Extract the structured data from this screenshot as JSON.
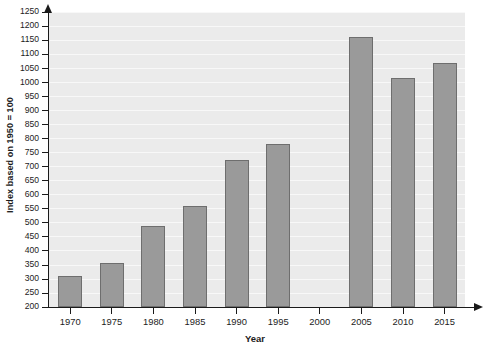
{
  "chart_data": {
    "type": "bar",
    "title": "",
    "xlabel": "Year",
    "ylabel": "Index based on 1950 = 100",
    "categories": [
      "1970",
      "1975",
      "1980",
      "1985",
      "1990",
      "1995",
      "2000",
      "2005",
      "2010",
      "2015"
    ],
    "values": [
      310,
      355,
      487,
      557,
      722,
      778,
      null,
      1160,
      1015,
      1070
    ],
    "ylim": [
      200,
      1250
    ],
    "ytick_labels": [
      "200",
      "250",
      "300",
      "350",
      "400",
      "450",
      "500",
      "550",
      "600",
      "650",
      "700",
      "750",
      "800",
      "850",
      "900",
      "950",
      "1000",
      "1050",
      "1100",
      "1150",
      "1200",
      "1250"
    ],
    "ytick_values": [
      200,
      250,
      300,
      350,
      400,
      450,
      500,
      550,
      600,
      650,
      700,
      750,
      800,
      850,
      900,
      950,
      1000,
      1050,
      1100,
      1150,
      1200,
      1250
    ],
    "grid": true,
    "legend": "none",
    "bar_color": "#9a9a9a",
    "bar_edge_color": "#6e6e6e",
    "plot_background": "#ebebeb",
    "axis_color": "#1a1a1a"
  }
}
